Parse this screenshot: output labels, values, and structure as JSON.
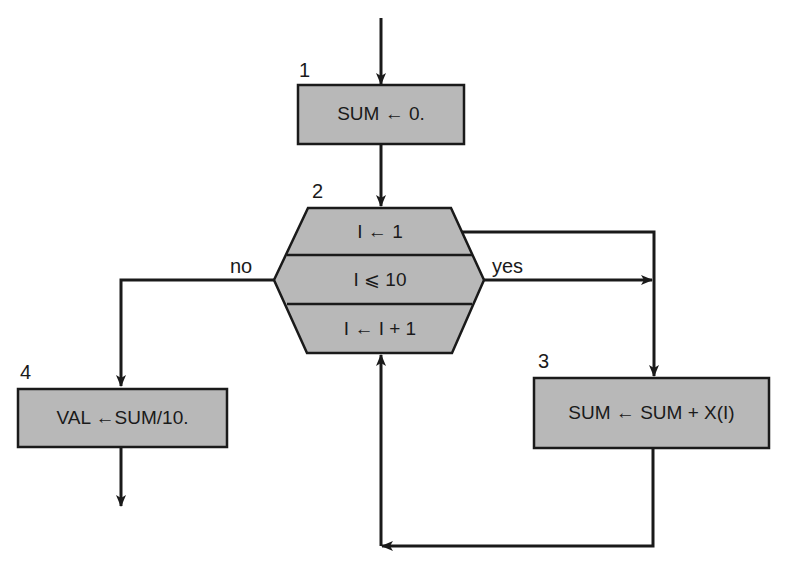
{
  "diagram": {
    "type": "flowchart",
    "colors": {
      "fill": "#b8b8b8",
      "stroke": "#1a1a1a",
      "background": "#ffffff"
    },
    "nodes": [
      {
        "id": "1",
        "number": "1",
        "shape": "process",
        "text": "SUM ← 0."
      },
      {
        "id": "2",
        "number": "2",
        "shape": "loop-hexagon",
        "sections": {
          "init": "I ← 1",
          "test": "I ⩽ 10",
          "increment": "I ← I + 1"
        }
      },
      {
        "id": "3",
        "number": "3",
        "shape": "process",
        "text": "SUM ← SUM + X(I)"
      },
      {
        "id": "4",
        "number": "4",
        "shape": "process",
        "text": "VAL ←SUM/10."
      }
    ],
    "edge_labels": {
      "yes": "yes",
      "no": "no"
    },
    "edges": [
      {
        "from": "entry",
        "to": "1"
      },
      {
        "from": "1",
        "to": "2"
      },
      {
        "from": "2",
        "to": "3",
        "label": "yes"
      },
      {
        "from": "2",
        "to": "4",
        "label": "no"
      },
      {
        "from": "3",
        "to": "2"
      },
      {
        "from": "4",
        "to": "exit"
      }
    ]
  }
}
